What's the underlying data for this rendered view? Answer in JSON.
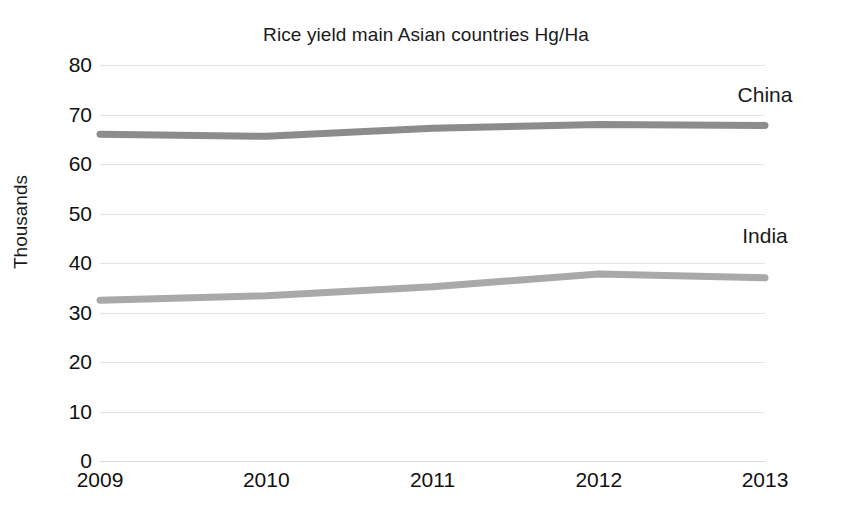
{
  "chart_data": {
    "type": "line",
    "title": "Rice yield main Asian countries Hg/Ha",
    "xlabel": "",
    "ylabel": "Thousands",
    "categories": [
      "2009",
      "2010",
      "2011",
      "2012",
      "2013"
    ],
    "x": [
      2009,
      2010,
      2011,
      2012,
      2013
    ],
    "ylim": [
      0,
      80
    ],
    "yticks": [
      0,
      10,
      20,
      30,
      40,
      50,
      60,
      70,
      80
    ],
    "ytick_labels": [
      "0",
      "10",
      "20",
      "30",
      "40",
      "50",
      "60",
      "70",
      "80"
    ],
    "grid": true,
    "legend": "inline-series-labels",
    "series": [
      {
        "name": "China",
        "color": "#8c8c8c",
        "values": [
          66.0,
          65.6,
          67.2,
          68.0,
          67.8
        ],
        "label_x": 2013,
        "label_y": 73.5
      },
      {
        "name": "India",
        "color": "#a9a9a9",
        "values": [
          32.5,
          33.4,
          35.2,
          37.8,
          37.0
        ],
        "label_x": 2013,
        "label_y": 45.0
      }
    ]
  },
  "colors": {
    "background": "#ffffff",
    "gridline": "#e4e4e4",
    "baseline": "#d8d8d8",
    "text": "#111111",
    "china_line": "#8c8c8c",
    "india_line": "#a9a9a9"
  }
}
